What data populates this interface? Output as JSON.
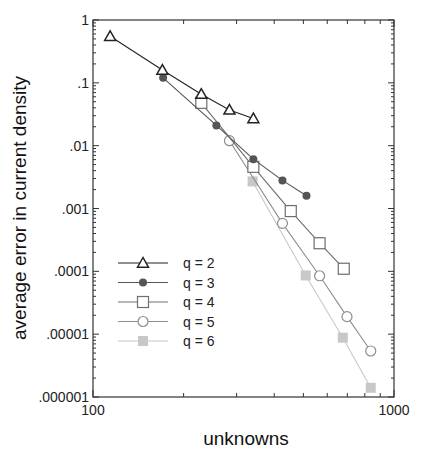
{
  "chart_data": {
    "type": "line",
    "title": "",
    "xlabel": "unknowns",
    "ylabel": "average error in current density",
    "xscale": "log",
    "yscale": "log",
    "xlim": [
      100,
      1000
    ],
    "ylim": [
      1e-06,
      1
    ],
    "x_ticks": [
      {
        "value": 100,
        "label": "100"
      },
      {
        "value": 1000,
        "label": "1000"
      }
    ],
    "y_ticks": [
      {
        "value": 1,
        "label": "1"
      },
      {
        "value": 0.1,
        "label": ".1"
      },
      {
        "value": 0.01,
        "label": ".01"
      },
      {
        "value": 0.001,
        "label": ".001"
      },
      {
        "value": 0.0001,
        "label": ".0001"
      },
      {
        "value": 1e-05,
        "label": ".00001"
      },
      {
        "value": 1e-06,
        "label": ".000001"
      }
    ],
    "grid": false,
    "legend_position": "lower-left inside",
    "series": [
      {
        "name": "q = 2",
        "marker": "open-triangle",
        "color": "#222222",
        "x": [
          114,
          170,
          229,
          284,
          341
        ],
        "y": [
          0.55,
          0.16,
          0.066,
          0.037,
          0.027
        ]
      },
      {
        "name": "q = 3",
        "marker": "filled-circle",
        "color": "#555555",
        "x": [
          171,
          257,
          341,
          426,
          512
        ],
        "y": [
          0.12,
          0.021,
          0.0061,
          0.0028,
          0.0016
        ]
      },
      {
        "name": "q = 4",
        "marker": "open-square",
        "color": "#6e6e6e",
        "x": [
          229,
          341,
          454,
          566,
          681
        ],
        "y": [
          0.048,
          0.0046,
          0.00091,
          0.00028,
          0.00011
        ]
      },
      {
        "name": "q = 5",
        "marker": "open-circle",
        "color": "#8e8e8e",
        "x": [
          284,
          426,
          566,
          698,
          837
        ],
        "y": [
          0.012,
          0.00058,
          8.5e-05,
          1.9e-05,
          5.4e-06
        ]
      },
      {
        "name": "q = 6",
        "marker": "filled-square",
        "color": "#c8c8c8",
        "x": [
          339,
          509,
          676,
          837
        ],
        "y": [
          0.0027,
          8.6e-05,
          8.8e-06,
          1.4e-06
        ]
      }
    ]
  }
}
